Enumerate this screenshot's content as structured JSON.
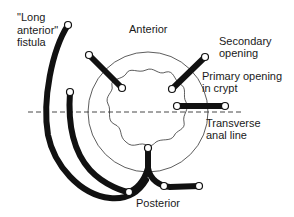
{
  "labels": {
    "long_anterior_l1": "\"Long",
    "long_anterior_l2": "anterior\"",
    "long_anterior_l3": "fistula",
    "anterior": "Anterior",
    "secondary_l1": "Secondary",
    "secondary_l2": "opening",
    "primary_l1": "Primary opening",
    "primary_l2": "in crypt",
    "transverse_l1": "Transverse",
    "transverse_l2": "anal line",
    "posterior": "Posterior"
  },
  "colors": {
    "tract": "#111111",
    "outline": "#333333",
    "background": "#ffffff"
  }
}
